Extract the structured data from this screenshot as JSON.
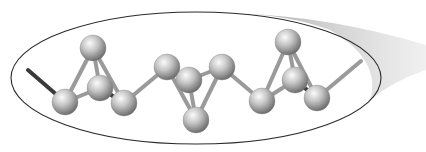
{
  "diagram": {
    "type": "ball-and-stick molecular chain in elliptical zoom callout",
    "colors": {
      "background": "#ffffff",
      "ellipse_stroke": "#2a2a2a",
      "bond": "#9a9a9a",
      "bond_dark": "#3a3a3a",
      "atom_light": "#f4f4f4",
      "atom_mid": "#b8b8b8",
      "atom_dark": "#6e6e6e",
      "callout_shadow": "#bdbdbd"
    },
    "ellipse": {
      "cx": 196,
      "cy": 78,
      "rx": 185,
      "ry": 66
    },
    "atom_radius": 13,
    "atoms": [
      {
        "id": "a1",
        "x": 65,
        "y": 102
      },
      {
        "id": "a2",
        "x": 93,
        "y": 48
      },
      {
        "id": "a3",
        "x": 100,
        "y": 88
      },
      {
        "id": "a4",
        "x": 124,
        "y": 103
      },
      {
        "id": "a5",
        "x": 167,
        "y": 67
      },
      {
        "id": "a6",
        "x": 189,
        "y": 80
      },
      {
        "id": "a7",
        "x": 196,
        "y": 120
      },
      {
        "id": "a8",
        "x": 222,
        "y": 67
      },
      {
        "id": "a9",
        "x": 262,
        "y": 101
      },
      {
        "id": "a10",
        "x": 288,
        "y": 42
      },
      {
        "id": "a11",
        "x": 295,
        "y": 80
      },
      {
        "id": "a12",
        "x": 317,
        "y": 98
      }
    ],
    "chain_ends": {
      "left": {
        "x": 28,
        "y": 70
      },
      "right": {
        "x": 361,
        "y": 61
      }
    }
  }
}
